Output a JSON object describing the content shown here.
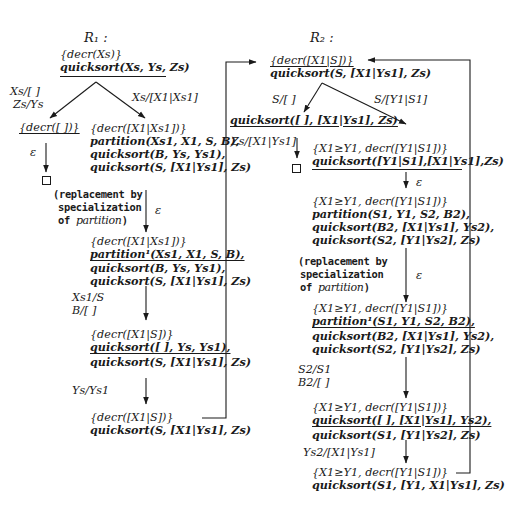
{
  "page_number": "",
  "r1": {
    "title": "R₁ :",
    "root": {
      "line1": "{decr(Xs)}",
      "line2": "quicksort(Xs, Ys, Zs)"
    },
    "edge_left_label_1": "Xs/[ ]",
    "edge_left_label_2": "Zs/Ys",
    "edge_right_label": "Xs/[X1|Xs1]",
    "left_leaf": {
      "line1": "{decr([ ])}",
      "eps": "ε"
    },
    "node_a": {
      "line1": "{decr([X1|Xs1])}",
      "line2": "partition(Xs1, X1, S, B),",
      "line3": "quicksort(B, Ys, Ys1),",
      "line4": "quicksort(S, [X1|Ys1], Zs)"
    },
    "replacement_note": {
      "line1": "(replacement by",
      "line2": "specialization",
      "line3_prefix": "of ",
      "line3_italic": "partition",
      "line3_suffix": ")"
    },
    "eps_a": "ε",
    "node_b": {
      "line1": "{decr([X1|Xs1])}",
      "line2": "partition¹(Xs1, X1, S, B),",
      "line3": "quicksort(B, Ys, Ys1),",
      "line4": "quicksort(S, [X1|Ys1], Zs)"
    },
    "edge_b_label_1": "Xs1/S",
    "edge_b_label_2": "B/[ ]",
    "node_c": {
      "line1": "{decr([X1|S])}",
      "line2": "quicksort([ ], Ys, Ys1),",
      "line3": "quicksort(S, [X1|Ys1], Zs)"
    },
    "edge_c_label": "Ys/Ys1",
    "node_d": {
      "line1": "{decr([X1|S])}",
      "line2": "quicksort(S, [X1|Ys1], Zs)"
    }
  },
  "r2": {
    "title": "R₂ :",
    "root": {
      "line1": "{decr([X1|S])}",
      "line2": "quicksort(S, [X1|Ys1], Zs)"
    },
    "edge_left_label": "S/[ ]",
    "edge_right_label": "S/[Y1|S1]",
    "left_leaf": {
      "line1": "quicksort([ ], [X1|Ys1], Zs)",
      "edge_label": "Zs/[X1|Ys1]"
    },
    "node_a": {
      "line1": "{X1≥Y1, decr([Y1|S1])}",
      "line2": "quicksort([Y1|S1],[X1|Ys1],Zs)"
    },
    "eps_a": "ε",
    "node_b": {
      "line1": "{X1≥Y1, decr([Y1|S1])}",
      "line2": "partition(S1, Y1, S2, B2),",
      "line3": "quicksort(B2, [X1|Ys1], Ys2),",
      "line4": "quicksort(S2, [Y1|Ys2], Zs)"
    },
    "replacement_note": {
      "line1": "(replacement by",
      "line2": "specialization",
      "line3_prefix": "of ",
      "line3_italic": "partition",
      "line3_suffix": ")"
    },
    "eps_b": "ε",
    "node_c": {
      "line1": "{X1≥Y1, decr([Y1|S1])}",
      "line2": "partition¹(S1, Y1, S2, B2),",
      "line3": "quicksort(B2, [X1|Ys1], Ys2),",
      "line4": "quicksort(S2, [Y1|Ys2], Zs)"
    },
    "edge_c_label_1": "S2/S1",
    "edge_c_label_2": "B2/[ ]",
    "node_d": {
      "line1": "{X1≥Y1, decr([Y1|S1])}",
      "line2": "quicksort([ ], [X1|Ys1], Ys2),",
      "line3": "quicksort(S1, [Y1|Ys2], Zs)"
    },
    "edge_d_label": "Ys2/[X1|Ys1]",
    "node_e": {
      "line1": "{X1≥Y1, decr([Y1|S1])}",
      "line2": "quicksort(S1, [Y1, X1|Ys1], Zs)"
    }
  },
  "icons": {
    "empty_clause": "empty-clause-box",
    "arrow": "arrow-down"
  },
  "colors": {
    "ink": "#1a1a1a",
    "background": "#ffffff"
  }
}
